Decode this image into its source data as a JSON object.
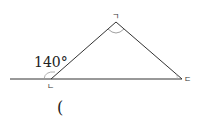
{
  "diagram": {
    "type": "triangle-exterior-angle",
    "vertices": {
      "top": {
        "label": "ㄱ"
      },
      "left": {
        "label": "ㄴ"
      },
      "right": {
        "label": "ㄷ"
      }
    },
    "exterior_angle": {
      "at": "ㄴ",
      "value": "140°"
    },
    "answer_blank": "("
  },
  "colors": {
    "line": "#333333",
    "arc": "#888888"
  }
}
